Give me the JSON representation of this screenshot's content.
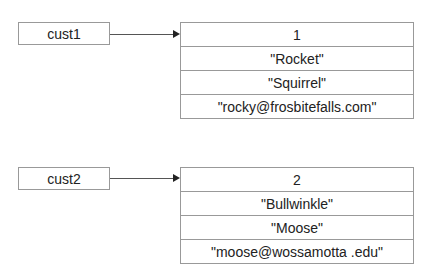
{
  "diagram": {
    "references": [
      {
        "variable": "cust1",
        "record": [
          "1",
          "\"Rocket\"",
          "\"Squirrel\"",
          "\"rocky@frosbitefalls.com\""
        ]
      },
      {
        "variable": "cust2",
        "record": [
          "2",
          "\"Bullwinkle\"",
          "\"Moose\"",
          "\"moose@wossamotta .edu\""
        ]
      }
    ]
  }
}
